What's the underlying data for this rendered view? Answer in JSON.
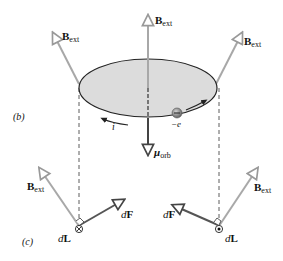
{
  "panel_labels": {
    "b": "(b)",
    "c": "(c)"
  },
  "vectors": {
    "b_ext": {
      "main": "B",
      "sub": "ext"
    },
    "mu_orb": {
      "main": "μ",
      "sub": "orb"
    },
    "dF": {
      "prefix": "d",
      "main": "F"
    },
    "dL": {
      "prefix": "d",
      "main": "L"
    }
  },
  "labels": {
    "current": "i",
    "electron": "−e"
  },
  "colors": {
    "disk_fill": "#dcdcdc",
    "disk_stroke": "#222222",
    "field_arrow": "#a8a8a8",
    "force_arrow": "#555555",
    "axis": "#888888",
    "electron": "#8a8a8a"
  }
}
